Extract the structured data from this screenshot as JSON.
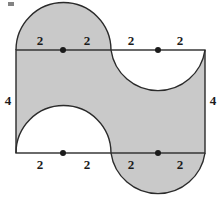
{
  "figure": {
    "name": "shaded-region-composite-figure",
    "colors": {
      "shade_fill": "#c9c9c9",
      "stroke": "#2b2b2b",
      "background": "#ffffff",
      "label_color": "#1b1b1b",
      "dot_color": "#1b1b1b"
    },
    "rectangle": {
      "x": 16,
      "y": 50,
      "width": 189,
      "height": 103,
      "unit_length_px": 23.6
    },
    "semicircles": [
      {
        "name": "top-left-semicircle",
        "center_x": 63,
        "edge": "top",
        "direction": "outward-up",
        "shaded": true,
        "radius_units": 2
      },
      {
        "name": "top-right-semicircle",
        "center_x": 158,
        "edge": "top",
        "direction": "inward-down",
        "shaded": false,
        "radius_units": 2
      },
      {
        "name": "bottom-left-semicircle",
        "center_x": 63,
        "edge": "bottom",
        "direction": "inward-up",
        "shaded": false,
        "radius_units": 2
      },
      {
        "name": "bottom-right-semicircle",
        "center_x": 158,
        "edge": "bottom",
        "direction": "outward-down",
        "shaded": true,
        "radius_units": 2
      }
    ],
    "midpoint_dots": [
      {
        "name": "dot-top-left",
        "x": 63,
        "y": 50
      },
      {
        "name": "dot-top-right",
        "x": 158,
        "y": 50
      },
      {
        "name": "dot-bottom-left",
        "x": 63,
        "y": 153
      },
      {
        "name": "dot-bottom-right",
        "x": 158,
        "y": 153
      }
    ],
    "labels": {
      "top": [
        {
          "name": "label-top-1",
          "text": "2",
          "x": 40,
          "y": 34
        },
        {
          "name": "label-top-2",
          "text": "2",
          "x": 87,
          "y": 34
        },
        {
          "name": "label-top-3",
          "text": "2",
          "x": 131,
          "y": 34
        },
        {
          "name": "label-top-4",
          "text": "2",
          "x": 180,
          "y": 34
        }
      ],
      "bottom": [
        {
          "name": "label-bottom-1",
          "text": "2",
          "x": 40,
          "y": 158
        },
        {
          "name": "label-bottom-2",
          "text": "2",
          "x": 87,
          "y": 158
        },
        {
          "name": "label-bottom-3",
          "text": "2",
          "x": 131,
          "y": 158
        },
        {
          "name": "label-bottom-4",
          "text": "2",
          "x": 180,
          "y": 158
        }
      ],
      "sides": [
        {
          "name": "label-left-height",
          "text": "4",
          "x": 4,
          "y": 95
        },
        {
          "name": "label-right-height",
          "text": "4",
          "x": 209,
          "y": 95
        }
      ]
    },
    "artifact": {
      "name": "scan-speck",
      "x": 8,
      "y": 2,
      "width": 6,
      "height": 4
    }
  }
}
